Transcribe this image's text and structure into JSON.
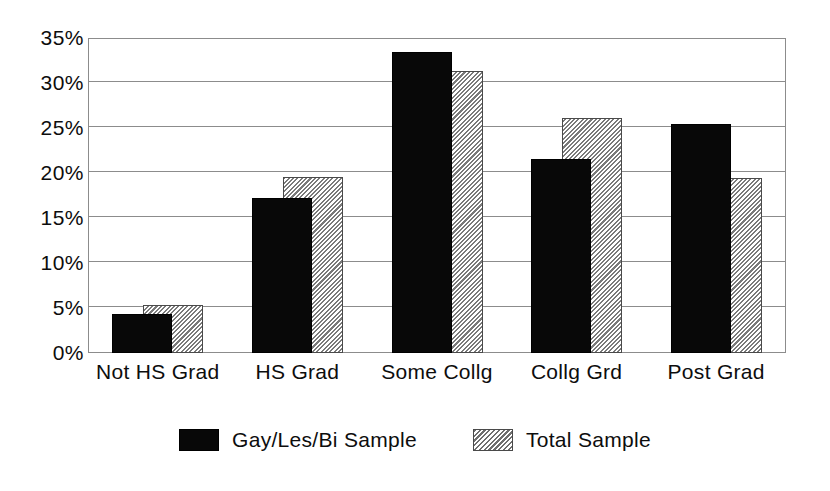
{
  "chart_data": {
    "type": "bar",
    "title": "",
    "subtitle": "",
    "xlabel": "",
    "ylabel": "",
    "categories": [
      "Not HS Grad",
      "HS Grad",
      "Some Collg",
      "Collg Grd",
      "Post Grad"
    ],
    "series": [
      {
        "name": "Gay/Les/Bi Sample",
        "color": "#080808",
        "fill": "solid-black",
        "values": [
          4.3,
          17.2,
          33.4,
          21.6,
          25.4
        ]
      },
      {
        "name": "Total Sample",
        "color": "#d2d2d2",
        "fill": "diagonal-hatch",
        "values": [
          5.3,
          19.6,
          31.3,
          26.1,
          19.5
        ]
      }
    ],
    "ylim": [
      0,
      35
    ],
    "ytick_values": [
      0,
      5,
      10,
      15,
      20,
      25,
      30,
      35
    ],
    "ytick_labels": [
      "0%",
      "5%",
      "10%",
      "15%",
      "20%",
      "25%",
      "30%",
      "35%"
    ],
    "value_unit": "%",
    "grid": true,
    "grid_axis": "y",
    "legend_position": "bottom-center",
    "bar_style": "overlapped-offset",
    "frame_color": "#8c8c8c"
  },
  "legend": {
    "entries": [
      {
        "label": "Gay/Les/Bi Sample",
        "swatch": "solid-black-swatch"
      },
      {
        "label": "Total Sample",
        "swatch": "hatched-swatch"
      }
    ]
  }
}
